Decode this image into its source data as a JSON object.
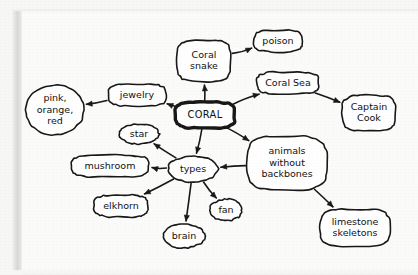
{
  "diagram": {
    "ink_color": "#181818",
    "paper_color": "#fbfbfa",
    "nodes": [
      {
        "id": "coral",
        "label": "CORAL",
        "shape": "rounded-rect",
        "central": true,
        "cx": 205,
        "cy": 115,
        "rx": 30,
        "ry": 13,
        "lines": [
          "CORAL"
        ]
      },
      {
        "id": "coral_snake",
        "label": "Coral snake",
        "shape": "rounded-rect",
        "central": false,
        "cx": 204,
        "cy": 61,
        "rx": 27,
        "ry": 21,
        "lines": [
          "Coral",
          "snake"
        ]
      },
      {
        "id": "poison",
        "label": "poison",
        "shape": "rounded-rect",
        "central": false,
        "cx": 278,
        "cy": 41,
        "rx": 24,
        "ry": 11,
        "lines": [
          "poison"
        ]
      },
      {
        "id": "coral_sea",
        "label": "Coral Sea",
        "shape": "rounded-rect",
        "central": false,
        "cx": 288,
        "cy": 83,
        "rx": 31,
        "ry": 11,
        "lines": [
          "Coral Sea"
        ]
      },
      {
        "id": "captain",
        "label": "Captain Cook",
        "shape": "rounded-rect",
        "central": false,
        "cx": 369,
        "cy": 113,
        "rx": 27,
        "ry": 18,
        "lines": [
          "Captain",
          "Cook"
        ]
      },
      {
        "id": "jewelry",
        "label": "jewelry",
        "shape": "rounded-rect",
        "central": false,
        "cx": 137,
        "cy": 95,
        "rx": 29,
        "ry": 11,
        "lines": [
          "jewelry"
        ]
      },
      {
        "id": "colors",
        "label": "pink, orange, red",
        "shape": "ellipse",
        "central": false,
        "cx": 55,
        "cy": 110,
        "rx": 29,
        "ry": 25,
        "lines": [
          "pink,",
          "orange,",
          "red"
        ]
      },
      {
        "id": "types",
        "label": "types",
        "shape": "ellipse",
        "central": false,
        "cx": 193,
        "cy": 169,
        "rx": 25,
        "ry": 13,
        "lines": [
          "types"
        ]
      },
      {
        "id": "star",
        "label": "star",
        "shape": "ellipse",
        "central": false,
        "cx": 139,
        "cy": 134,
        "rx": 20,
        "ry": 10,
        "lines": [
          "star"
        ]
      },
      {
        "id": "mushroom",
        "label": "mushroom",
        "shape": "rounded-rect",
        "central": false,
        "cx": 110,
        "cy": 166,
        "rx": 39,
        "ry": 11,
        "lines": [
          "mushroom"
        ]
      },
      {
        "id": "elkhorn",
        "label": "elkhorn",
        "shape": "rounded-rect",
        "central": false,
        "cx": 121,
        "cy": 206,
        "rx": 27,
        "ry": 11,
        "lines": [
          "elkhorn"
        ]
      },
      {
        "id": "brain",
        "label": "brain",
        "shape": "ellipse",
        "central": false,
        "cx": 184,
        "cy": 236,
        "rx": 21,
        "ry": 12,
        "lines": [
          "brain"
        ]
      },
      {
        "id": "fan",
        "label": "fan",
        "shape": "ellipse",
        "central": false,
        "cx": 226,
        "cy": 210,
        "rx": 16,
        "ry": 11,
        "lines": [
          "fan"
        ]
      },
      {
        "id": "animals",
        "label": "animals without backbones",
        "shape": "rounded-rect",
        "central": false,
        "cx": 287,
        "cy": 163,
        "rx": 40,
        "ry": 27,
        "lines": [
          "animals",
          "without",
          "backbones"
        ]
      },
      {
        "id": "limestone",
        "label": "limestone skeletons",
        "shape": "rounded-rect",
        "central": false,
        "cx": 355,
        "cy": 228,
        "rx": 35,
        "ry": 19,
        "lines": [
          "limestone",
          "skeletons"
        ]
      }
    ],
    "edges": [
      {
        "from": "coral",
        "to": "coral_snake",
        "label": ""
      },
      {
        "from": "coral_snake",
        "to": "poison",
        "label": ""
      },
      {
        "from": "coral",
        "to": "coral_sea",
        "label": ""
      },
      {
        "from": "coral_sea",
        "to": "captain",
        "label": ""
      },
      {
        "from": "coral",
        "to": "jewelry",
        "label": ""
      },
      {
        "from": "jewelry",
        "to": "colors",
        "label": ""
      },
      {
        "from": "coral",
        "to": "types",
        "label": ""
      },
      {
        "from": "coral",
        "to": "animals",
        "label": ""
      },
      {
        "from": "animals",
        "to": "types",
        "label": ""
      },
      {
        "from": "animals",
        "to": "limestone",
        "label": ""
      },
      {
        "from": "types",
        "to": "star",
        "label": ""
      },
      {
        "from": "types",
        "to": "mushroom",
        "label": ""
      },
      {
        "from": "types",
        "to": "elkhorn",
        "label": ""
      },
      {
        "from": "types",
        "to": "brain",
        "label": ""
      },
      {
        "from": "types",
        "to": "fan",
        "label": ""
      }
    ]
  }
}
